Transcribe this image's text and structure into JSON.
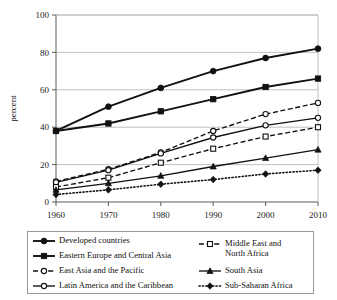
{
  "chart": {
    "type": "line",
    "title": "",
    "xlabel": "",
    "ylabel": "percent",
    "xticks": [
      "1960",
      "1970",
      "1980",
      "1990",
      "2000",
      "2010"
    ],
    "yticks": [
      "0",
      "20",
      "40",
      "60",
      "80",
      "100"
    ],
    "ylim_min": 0,
    "ylim_max": 100,
    "xlim_min": 1960,
    "xlim_max": 2010,
    "grid": "horizontal",
    "legend_position": "below-plot"
  },
  "chart_data": {
    "type": "line",
    "title": "",
    "xlabel": "",
    "ylabel": "percent",
    "x": [
      1960,
      1970,
      1980,
      1990,
      2000,
      2010
    ],
    "xlim": [
      1960,
      2010
    ],
    "ylim": [
      0,
      100
    ],
    "xtick_labels": [
      "1960",
      "1970",
      "1980",
      "1990",
      "2000",
      "2010"
    ],
    "ytick_labels": [
      "0",
      "20",
      "40",
      "60",
      "80",
      "100"
    ],
    "grid": "horizontal gridlines at 0,20,40,60,80,100",
    "legend_position": "below plot, two columns, boxed",
    "series": [
      {
        "name": "Developed countries",
        "marker": "filled-circle",
        "line_style": "solid",
        "color": "#111111",
        "values": [
          38,
          51,
          61,
          70,
          77,
          82
        ]
      },
      {
        "name": "Eastern Europe and Central Asia",
        "marker": "filled-square",
        "line_style": "solid",
        "color": "#111111",
        "values": [
          38,
          42,
          48.5,
          55,
          61.5,
          66
        ]
      },
      {
        "name": "East Asia and the Pacific",
        "marker": "open-circle",
        "line_style": "dashed",
        "color": "#111111",
        "values": [
          11,
          17.5,
          26.5,
          38,
          47,
          53
        ]
      },
      {
        "name": "Latin America and the Caribbean",
        "marker": "open-circle",
        "line_style": "solid",
        "color": "#111111",
        "values": [
          10.5,
          17,
          26,
          34.5,
          41,
          45
        ]
      },
      {
        "name": "Middle East and North Africa",
        "marker": "open-square",
        "line_style": "dashed",
        "color": "#111111",
        "values": [
          8,
          13,
          21,
          28.5,
          35,
          40
        ]
      },
      {
        "name": "South Asia",
        "marker": "filled-triangle",
        "line_style": "solid",
        "color": "#111111",
        "values": [
          6.5,
          10,
          14,
          19,
          23.5,
          28
        ]
      },
      {
        "name": "Sub-Saharan Africa",
        "marker": "filled-diamond",
        "line_style": "dotted",
        "color": "#111111",
        "values": [
          4,
          6.5,
          9.5,
          12,
          15,
          17
        ]
      }
    ]
  },
  "legend": {
    "column_left": [
      {
        "label": "Developed countries",
        "marker": "filled-circle",
        "line_style": "solid"
      },
      {
        "label": "Eastern Europe and Central Asia",
        "marker": "filled-square",
        "line_style": "solid"
      },
      {
        "label": "East Asia and the Pacific",
        "marker": "open-circle",
        "line_style": "dashed"
      },
      {
        "label": "Latin America and the Caribbean",
        "marker": "open-circle",
        "line_style": "solid"
      }
    ],
    "column_right": [
      {
        "label": "Middle East and\nNorth Africa",
        "marker": "open-square",
        "line_style": "dashed"
      },
      {
        "label": "South Asia",
        "marker": "filled-triangle",
        "line_style": "solid"
      },
      {
        "label": "Sub-Saharan Africa",
        "marker": "filled-diamond",
        "line_style": "dotted"
      }
    ]
  }
}
